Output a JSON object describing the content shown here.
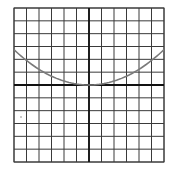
{
  "chart_data": {
    "type": "line",
    "title": "",
    "xlabel": "",
    "ylabel": "",
    "grid": true,
    "grid_cells": {
      "columns": 12,
      "rows": 12
    },
    "xlim": [
      -6,
      6
    ],
    "ylim": [
      -6,
      6
    ],
    "axes_at_origin": true,
    "tick_labels": [],
    "legend": [],
    "series": [
      {
        "name": "parabola",
        "equation_estimate": "y = 0.076 x^2",
        "color": "#7a7a7a",
        "x": [
          -6,
          -5,
          -4,
          -3,
          -2,
          -1,
          0,
          1,
          2,
          3,
          4,
          5,
          6
        ],
        "y": [
          2.75,
          1.9,
          1.22,
          0.69,
          0.3,
          0.08,
          0,
          0.08,
          0.3,
          0.69,
          1.22,
          1.9,
          2.75
        ]
      }
    ]
  },
  "colors": {
    "grid": "#3a3a3a",
    "axes": "#111111",
    "curve": "#7a7a7a",
    "background": "#ffffff"
  },
  "layout": {
    "plot_left": 14,
    "plot_top": 8,
    "plot_right": 164,
    "plot_bottom": 162
  }
}
